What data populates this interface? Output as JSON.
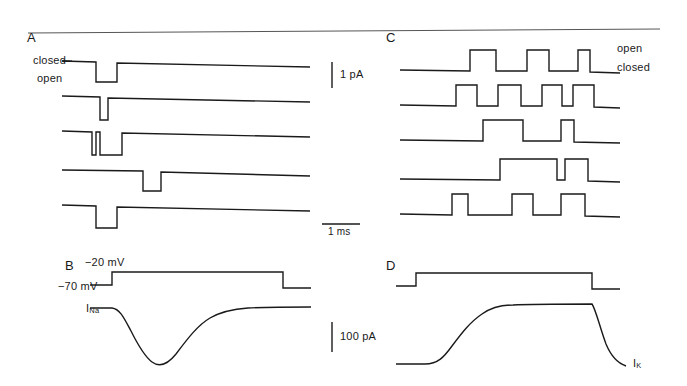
{
  "figure": {
    "background": "#ffffff",
    "stroke_color": "#1a1a1a",
    "width": 687,
    "height": 386
  },
  "top_rule": {
    "name": "horizontal-rule",
    "x1": 28,
    "y1": 33,
    "x2": 660,
    "y2": 29
  },
  "panels": {
    "A": {
      "letter": "A",
      "letter_x": 27,
      "letter_y": 30,
      "level_labels": [
        {
          "text": "closed",
          "x": 33,
          "y": 55
        },
        {
          "text": "open",
          "x": 37,
          "y": 73
        }
      ],
      "description": "Single Na+ channel openings as downward deflections",
      "traces": [
        {
          "baseline": 62,
          "open": 82,
          "events": [
            [
              96,
              117
            ]
          ]
        },
        {
          "baseline": 97,
          "open": 120,
          "events": [
            [
              100,
              108
            ]
          ]
        },
        {
          "baseline": 132,
          "open": 155,
          "events": [
            [
              92,
              96
            ],
            [
              100,
              122
            ]
          ]
        },
        {
          "baseline": 171,
          "open": 191,
          "events": [
            [
              143,
              161
            ]
          ]
        },
        {
          "baseline": 206,
          "open": 228,
          "events": [
            [
              96,
              117
            ]
          ]
        }
      ],
      "trace_x_start": 62,
      "trace_x_end": 310
    },
    "B": {
      "letter": "B",
      "letter_x": 65,
      "letter_y": 265,
      "voltage_labels": [
        {
          "text": "−20 mV",
          "x": 85,
          "y": 263
        },
        {
          "text": "−70 mV",
          "x": 64,
          "y": 287
        }
      ],
      "current_label": {
        "text": "I",
        "sub": "Na",
        "x": 86,
        "y": 308
      },
      "description": "Macroscopic inward Na+ current during voltage step from -70 mV to -20 mV"
    },
    "C": {
      "letter": "C",
      "letter_x": 386,
      "letter_y": 30,
      "level_labels": [
        {
          "text": "open",
          "x": 617,
          "y": 48
        },
        {
          "text": "closed",
          "x": 617,
          "y": 68
        }
      ],
      "description": "Single K+ channel openings as upward deflections",
      "traces": [
        {
          "baseline": 72,
          "open": 50,
          "events": [
            [
              470,
              496
            ],
            [
              527,
              549
            ],
            [
              578,
              590
            ]
          ]
        },
        {
          "baseline": 107,
          "open": 85,
          "events": [
            [
              456,
              477
            ],
            [
              498,
              521
            ],
            [
              542,
              562
            ],
            [
              573,
              594
            ]
          ]
        },
        {
          "baseline": 142,
          "open": 120,
          "events": [
            [
              483,
              523
            ],
            [
              561,
              574
            ]
          ]
        },
        {
          "baseline": 181,
          "open": 159,
          "events": [
            [
              500,
              557
            ],
            [
              565,
              588
            ]
          ]
        },
        {
          "baseline": 216,
          "open": 194,
          "events": [
            [
              452,
              468
            ],
            [
              512,
              533
            ],
            [
              561,
              585
            ]
          ]
        }
      ],
      "trace_x_start": 400,
      "trace_x_end": 620
    },
    "D": {
      "letter": "D",
      "letter_x": 386,
      "letter_y": 265,
      "current_label": {
        "text": "I",
        "sub": "K",
        "x": 633,
        "y": 364
      },
      "description": "Macroscopic outward K+ current during depolarizing voltage step"
    }
  },
  "scale_bars": {
    "current_single": {
      "name": "1 pA",
      "label": "1 pA",
      "x": 332,
      "y_top": 62,
      "y_bottom": 88,
      "label_x": 340,
      "label_y": 73
    },
    "time": {
      "name": "1 ms",
      "label": "1 ms",
      "x1": 322,
      "x2": 360,
      "y": 224,
      "label_x": 330,
      "label_y": 236
    },
    "current_macro": {
      "name": "100 pA",
      "label": "100 pA",
      "x": 332,
      "y_top": 322,
      "y_bottom": 352,
      "label_x": 340,
      "label_y": 336
    }
  }
}
